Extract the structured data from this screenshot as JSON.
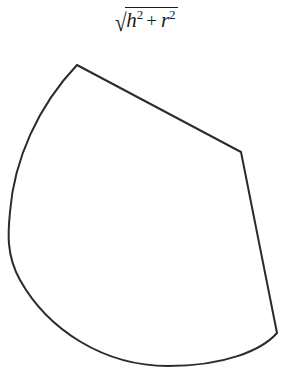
{
  "figure": {
    "name": "unrolled-cone-lateral-surface",
    "background_color": "#ffffff",
    "stroke_color": "#2b2b2b",
    "stroke_width": 2,
    "fill_color": "#ffffff",
    "width": 292,
    "height": 379
  },
  "label": {
    "full_text": "√(h² + r²)",
    "radical_sign": "√",
    "first_term_base": "h",
    "first_term_exponent": "2",
    "operator": "+",
    "second_term_base": "r",
    "second_term_exponent": "2",
    "color": "#1c1c1c",
    "position": "top-center"
  },
  "geometry": {
    "type": "circular-sector",
    "apex": {
      "x": 77,
      "y": 65
    },
    "right_corner": {
      "x": 241,
      "y": 152
    },
    "bottom_right_corner": {
      "x": 277,
      "y": 333
    },
    "leftmost_point": {
      "x": 9,
      "y": 215
    },
    "lowest_point": {
      "x": 165,
      "y": 366
    },
    "straight_edges": [
      {
        "from": "apex",
        "to": "right_corner"
      },
      {
        "from": "right_corner",
        "to": "bottom_right_corner"
      }
    ],
    "arc_edges": [
      {
        "from": "bottom_right_corner",
        "to": "apex",
        "direction": "counter-clockwise-through-bottom-and-left"
      }
    ],
    "path": "M 77 65 L 241 152 L 277 333 C 262 350 225 366 168 366 C 104 366 48 330 20 280 C 6 255 8 232 10 212 C 14 160 38 106 77 65 Z"
  }
}
